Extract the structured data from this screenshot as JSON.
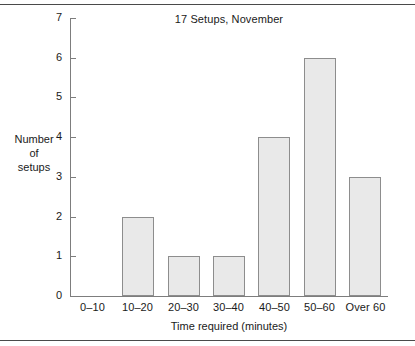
{
  "chart_data": {
    "type": "bar",
    "title": "17 Setups, November",
    "xlabel": "Time required (minutes)",
    "ylabel": "Number\nof\nsetups",
    "ylabel_lines": [
      "Number",
      "of",
      "setups"
    ],
    "categories": [
      "0–10",
      "10–20",
      "20–30",
      "30–40",
      "40–50",
      "50–60",
      "Over 60"
    ],
    "values": [
      0,
      2,
      1,
      1,
      4,
      6,
      3
    ],
    "ylim": [
      0,
      7
    ],
    "ytick_labels": [
      "0",
      "1",
      "2",
      "3",
      "4",
      "5",
      "6",
      "7"
    ],
    "yticks": [
      0,
      1,
      2,
      3,
      4,
      5,
      6,
      7
    ],
    "grid": false,
    "legend": null,
    "bar_fill_color": "#e9e9e9",
    "bar_border_color": "#8d8d8d",
    "axis_color": "#7d7d7d",
    "text_color": "#1a1a1a",
    "rule_color": "#4a4a4a",
    "background_color": "#ffffff"
  }
}
